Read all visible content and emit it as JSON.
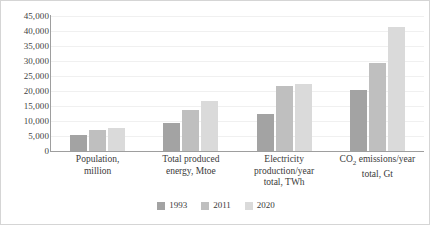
{
  "chart_data": {
    "type": "bar",
    "title": "",
    "subtitle": "",
    "xlabel": "",
    "ylabel": "",
    "ylim": [
      0,
      45000
    ],
    "ytick_interval": 5000,
    "ytick_labels": [
      "45,000",
      "40,000",
      "35,000",
      "30,000",
      "25,000",
      "20,000",
      "15,000",
      "10,000",
      "5,000",
      "0"
    ],
    "ytick_values": [
      45000,
      40000,
      35000,
      30000,
      25000,
      20000,
      15000,
      10000,
      5000,
      0
    ],
    "grid": true,
    "grid_axis": "y",
    "legend_position": "bottom",
    "categories": [
      "Population, million",
      "Total produced energy, Mtoe",
      "Electricity production/year total, TWh",
      "CO2 emissions/year total, Gt"
    ],
    "categories_display": [
      [
        "Population,",
        "million"
      ],
      [
        "Total produced",
        "energy, Mtoe"
      ],
      [
        "Electricity",
        "production/year",
        "total, TWh"
      ],
      [
        "CO|2| emissions/year",
        "total, Gt"
      ]
    ],
    "series": [
      {
        "name": "1993",
        "color": "#a3a3a3",
        "values": [
          5500,
          9300,
          12200,
          20500
        ]
      },
      {
        "name": "2011",
        "color": "#bfbfbf",
        "values": [
          7000,
          13800,
          21700,
          29400
        ]
      },
      {
        "name": "2020",
        "color": "#dadada",
        "values": [
          7800,
          16700,
          22400,
          41300
        ]
      }
    ]
  },
  "axis": {
    "tick0": "45,000",
    "tick1": "40,000",
    "tick2": "35,000",
    "tick3": "30,000",
    "tick4": "25,000",
    "tick5": "20,000",
    "tick6": "15,000",
    "tick7": "10,000",
    "tick8": "5,000",
    "tick9": "0"
  },
  "categories_text": {
    "c0l0": "Population,",
    "c0l1": "million",
    "c1l0": "Total produced",
    "c1l1": "energy, Mtoe",
    "c2l0": "Electricity",
    "c2l1": "production/year",
    "c2l2": "total, TWh",
    "c3l0a": "CO",
    "c3l0b": "2",
    "c3l0c": " emissions/year",
    "c3l1": "total, Gt"
  },
  "legend": {
    "items": [
      {
        "label": "1993",
        "color": "#a3a3a3"
      },
      {
        "label": "2011",
        "color": "#bfbfbf"
      },
      {
        "label": "2020",
        "color": "#dadada"
      }
    ]
  }
}
